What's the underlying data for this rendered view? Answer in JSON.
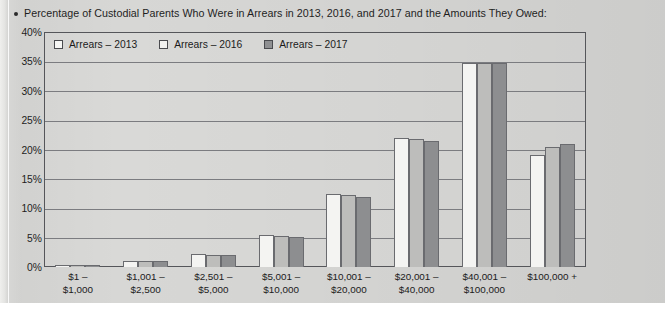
{
  "title": "Percentage of Custodial Parents Who Were in Arrears in 2013, 2016, and 2017 and the Amounts They Owed:",
  "bullet_glyph": "•",
  "legend": {
    "items": [
      {
        "label": "Arrears – 2013",
        "swatch": "white-square-swatch",
        "color": "#f6f6f4"
      },
      {
        "label": "Arrears – 2016",
        "swatch": "light-gray-square-swatch",
        "color": "#f2f2f0"
      },
      {
        "label": "Arrears – 2017",
        "swatch": "dark-gray-square-swatch",
        "color": "#8f9092"
      }
    ]
  },
  "chart_data": {
    "type": "bar",
    "title": "Percentage of Custodial Parents Who Were in Arrears in 2013, 2016, and 2017 and the Amounts They Owed:",
    "xlabel": "",
    "ylabel": "",
    "ylim": [
      0,
      40
    ],
    "ytick_labels": [
      "40%",
      "35%",
      "30%",
      "25%",
      "20%",
      "15%",
      "10%",
      "5%",
      "0%"
    ],
    "ytick_values": [
      40,
      35,
      30,
      25,
      20,
      15,
      10,
      5,
      0
    ],
    "grid": true,
    "legend_position": "top-left-inside",
    "categories": [
      "$1 – $1,000",
      "$1,001 – $2,500",
      "$2,501 – $5,000",
      "$5,001 – $10,000",
      "$10,001 – $20,000",
      "$20,001 – $40,000",
      "$40,001 – $100,000",
      "$100,000 +"
    ],
    "category_lines": [
      [
        "$1 –",
        "$1,000"
      ],
      [
        "$1,001 –",
        "$2,500"
      ],
      [
        "$2,501 –",
        "$5,000"
      ],
      [
        "$5,001 –",
        "$10,000"
      ],
      [
        "$10,001 –",
        "$20,000"
      ],
      [
        "$20,001 –",
        "$40,000"
      ],
      [
        "$40,001 –",
        "$100,000"
      ],
      [
        "$100,000 +",
        ""
      ]
    ],
    "series": [
      {
        "name": "Arrears – 2013",
        "color": "#f4f4f2",
        "values": [
          0.3,
          1.1,
          2.2,
          5.5,
          12.5,
          22.0,
          34.8,
          19.0
        ]
      },
      {
        "name": "Arrears – 2016",
        "color": "#bdbdbb",
        "values": [
          0.3,
          1.0,
          2.0,
          5.3,
          12.3,
          21.8,
          34.7,
          20.5
        ]
      },
      {
        "name": "Arrears – 2017",
        "color": "#8d8e90",
        "values": [
          0.3,
          1.0,
          2.1,
          5.1,
          12.0,
          21.5,
          34.7,
          21.0
        ]
      }
    ]
  }
}
